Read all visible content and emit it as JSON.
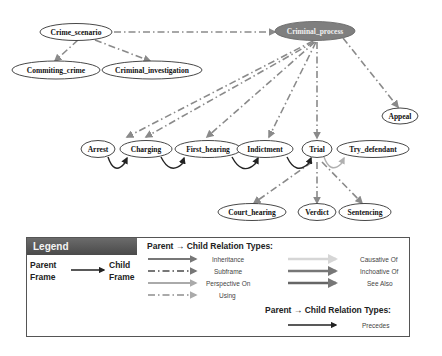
{
  "diagram": {
    "nodes": [
      {
        "id": "crime_scenario",
        "label": "Crime_scenario"
      },
      {
        "id": "commiting_crime",
        "label": "Commiting_crime"
      },
      {
        "id": "criminal_investigation",
        "label": "Criminal_investigation"
      },
      {
        "id": "criminal_process",
        "label": "Criminal_process",
        "highlighted": true
      },
      {
        "id": "appeal",
        "label": "Appeal"
      },
      {
        "id": "arrest",
        "label": "Arrest"
      },
      {
        "id": "charging",
        "label": "Charging"
      },
      {
        "id": "first_hearing",
        "label": "First_hearing"
      },
      {
        "id": "indictment",
        "label": "Indictment"
      },
      {
        "id": "trial",
        "label": "Trial"
      },
      {
        "id": "try_defendant",
        "label": "Try_defendant"
      },
      {
        "id": "court_hearing",
        "label": "Court_hearing"
      },
      {
        "id": "verdict",
        "label": "Verdict"
      },
      {
        "id": "sentencing",
        "label": "Sentencing"
      }
    ],
    "edges": [
      {
        "from": "crime_scenario",
        "to": "criminal_process",
        "type": "Subframe"
      },
      {
        "from": "crime_scenario",
        "to": "commiting_crime",
        "type": "Subframe"
      },
      {
        "from": "crime_scenario",
        "to": "criminal_investigation",
        "type": "Subframe"
      },
      {
        "from": "criminal_process",
        "to": "appeal",
        "type": "Subframe"
      },
      {
        "from": "criminal_process",
        "to": "arrest",
        "type": "Subframe"
      },
      {
        "from": "criminal_process",
        "to": "charging",
        "type": "Subframe"
      },
      {
        "from": "criminal_process",
        "to": "first_hearing",
        "type": "Subframe"
      },
      {
        "from": "criminal_process",
        "to": "indictment",
        "type": "Subframe"
      },
      {
        "from": "criminal_process",
        "to": "trial",
        "type": "Subframe"
      },
      {
        "from": "arrest",
        "to": "charging",
        "type": "Precedes"
      },
      {
        "from": "charging",
        "to": "first_hearing",
        "type": "Precedes"
      },
      {
        "from": "first_hearing",
        "to": "indictment",
        "type": "Precedes"
      },
      {
        "from": "indictment",
        "to": "trial",
        "type": "Precedes"
      },
      {
        "from": "trial",
        "to": "try_defendant",
        "type": "See Also"
      },
      {
        "from": "trial",
        "to": "court_hearing",
        "type": "Subframe"
      },
      {
        "from": "trial",
        "to": "verdict",
        "type": "Subframe"
      },
      {
        "from": "trial",
        "to": "sentencing",
        "type": "Subframe"
      }
    ]
  },
  "legend": {
    "title": "Legend",
    "parent_label_1": "Parent",
    "parent_label_2": "Frame",
    "child_label_1": "Child",
    "child_label_2": "Frame",
    "relation_header": "Parent → Child Relation Types:",
    "relation_header_2": "Parent → Child Relation Types:",
    "left_column": [
      "Inheritance",
      "Subframe",
      "Perspective On",
      "Using"
    ],
    "right_column": [
      "Causative Of",
      "Inchoative Of",
      "See Also"
    ],
    "precedes_label": "Precedes"
  },
  "colors": {
    "highlight_node": "#7f7f7f",
    "edge": "#8a8a8a",
    "precedes": "#222222",
    "legend_header": "#5a5a5a"
  }
}
